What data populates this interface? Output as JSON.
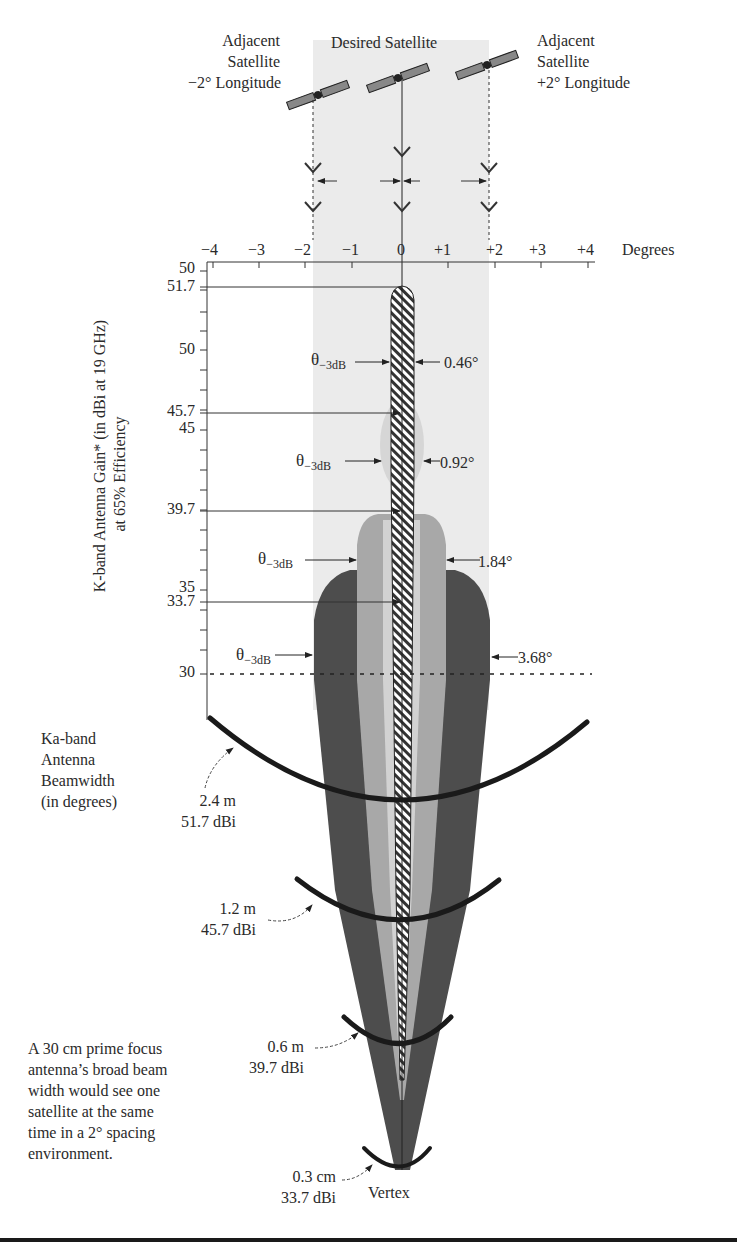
{
  "satellites": {
    "left_label": [
      "Adjacent",
      "Satellite",
      "−2° Longitude"
    ],
    "center_label": "Desired Satellite",
    "right_label": [
      "Adjacent",
      "Satellite",
      "+2° Longitude"
    ]
  },
  "x_axis": {
    "ticks": [
      "−4",
      "−3",
      "−2",
      "−1",
      "0",
      "+1",
      "+2",
      "+3",
      "+4"
    ],
    "unit_label": "Degrees"
  },
  "y_axis": {
    "title_line1": "K-band Antenna Gain* (in dBi at 19 GHz)",
    "title_line2": "at 65% Efficiency",
    "ticks": [
      "50",
      "51.7",
      "50",
      "45.7",
      "45",
      "39.7",
      "35",
      "33.7",
      "30"
    ]
  },
  "beams": [
    {
      "theta_label": "θ",
      "theta_sub": "−3dB",
      "width": "0.46°",
      "gain": "51.7"
    },
    {
      "theta_label": "θ",
      "theta_sub": "−3dB",
      "width": "0.92°",
      "gain": "45.7"
    },
    {
      "theta_label": "θ",
      "theta_sub": "−3dB",
      "width": "1.84°",
      "gain": "39.7"
    },
    {
      "theta_label": "θ",
      "theta_sub": "−3dB",
      "width": "3.68°",
      "gain": "33.7"
    }
  ],
  "legend": {
    "beamwidth_title": [
      "Ka-band",
      "Antenna",
      "Beamwidth",
      "(in degrees)"
    ]
  },
  "antennas": [
    {
      "size": "2.4 m",
      "gain": "51.7 dBi"
    },
    {
      "size": "1.2 m",
      "gain": "45.7 dBi"
    },
    {
      "size": "0.6 m",
      "gain": "39.7 dBi"
    },
    {
      "size": "0.3 cm",
      "gain": "33.7 dBi"
    }
  ],
  "vertex_label": "Vertex",
  "note": [
    "A 30 cm prime focus",
    "antenna’s broad beam",
    "width would see one",
    "satellite at the same",
    "time in a 2° spacing",
    "environment."
  ],
  "colors": {
    "band": "#ebebeb",
    "beam_dark": "#4d4d4d",
    "beam_mid": "#a8a8a8",
    "beam_light": "#d2d2d2",
    "ink": "#2a2a2a"
  }
}
